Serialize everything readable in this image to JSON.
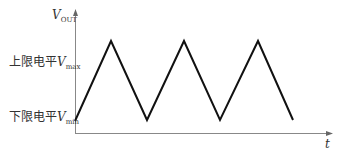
{
  "diagram": {
    "type": "triangle-waveform",
    "y_axis_label": {
      "symbol": "V",
      "subscript": "OUT"
    },
    "x_axis_label": "t",
    "upper_level": {
      "text": "上限电平",
      "symbol": "V",
      "subscript": "max"
    },
    "lower_level": {
      "text": "下限电平",
      "symbol": "V",
      "subscript": "min"
    },
    "waveform_points": [
      [
        75,
        121
      ],
      [
        111,
        41
      ],
      [
        147,
        120
      ],
      [
        184,
        41
      ],
      [
        220,
        120
      ],
      [
        258,
        41
      ],
      [
        293,
        120
      ]
    ],
    "colors": {
      "axis": "#888888",
      "waveform": "#111111",
      "text": "#333333"
    }
  }
}
